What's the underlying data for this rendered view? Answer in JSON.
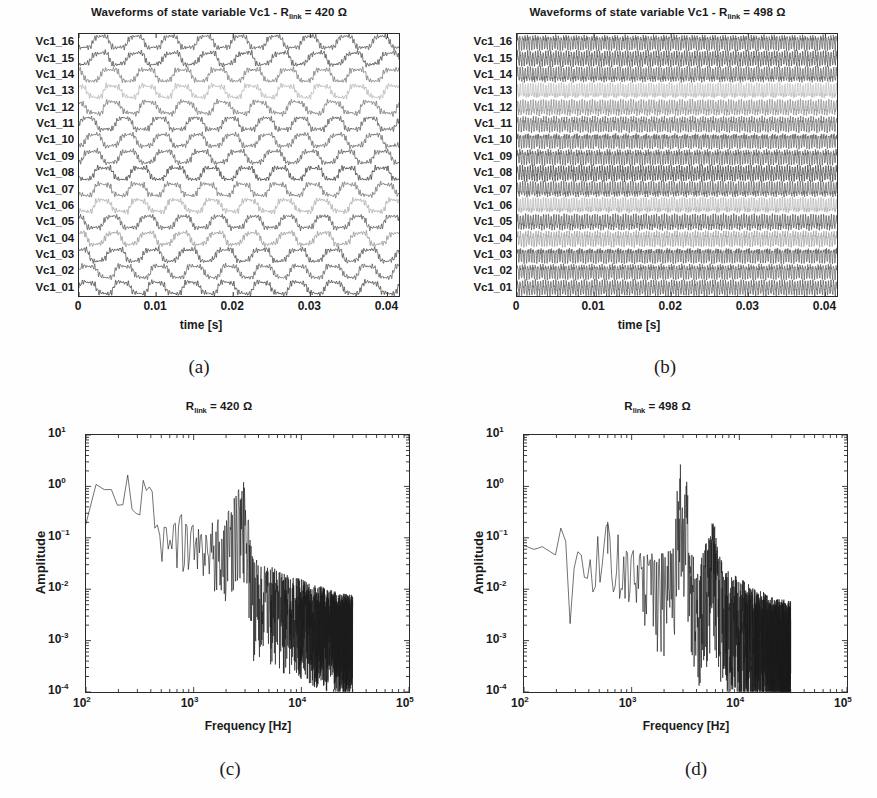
{
  "figure": {
    "background": "#fefefe",
    "ink": "#1a1a1a",
    "width": 877,
    "height": 798
  },
  "panels": [
    {
      "id": "a",
      "caption": "(a)",
      "title_prefix": "Waveforms of state variable Vc1 - R",
      "title_sub": "link",
      "title_suffix": " = 420 Ω",
      "xlabel": "time [s]",
      "ylabel": "",
      "xticks": [
        "0",
        "0.01",
        "0.02",
        "0.03",
        "0.04"
      ],
      "ytick_labels": [
        "Vc1_16",
        "Vc1_15",
        "Vc1_14",
        "Vc1_13",
        "Vc1_12",
        "Vc1_11",
        "Vc1_10",
        "Vc1_09",
        "Vc1_08",
        "Vc1_07",
        "Vc1_06",
        "Vc1_05",
        "Vc1_04",
        "Vc1_03",
        "Vc1_02",
        "Vc1_01"
      ]
    },
    {
      "id": "b",
      "caption": "(b)",
      "title_prefix": "Waveforms of state variable Vc1 - R",
      "title_sub": "link",
      "title_suffix": " = 498 Ω",
      "xlabel": "time [s]",
      "ylabel": "",
      "xticks": [
        "0",
        "0.01",
        "0.02",
        "0.03",
        "0.04"
      ],
      "ytick_labels": [
        "Vc1_16",
        "Vc1_15",
        "Vc1_14",
        "Vc1_13",
        "Vc1_12",
        "Vc1_11",
        "Vc1_10",
        "Vc1_09",
        "Vc1_08",
        "Vc1_07",
        "Vc1_06",
        "Vc1_05",
        "Vc1_04",
        "Vc1_03",
        "Vc1_02",
        "Vc1_01"
      ]
    },
    {
      "id": "c",
      "caption": "(c)",
      "title_prefix": "R",
      "title_sub": "link",
      "title_suffix": " = 420 Ω",
      "xlabel": "Frequency [Hz]",
      "ylabel": "Amplitude",
      "xticks": [
        "10²",
        "10³",
        "10⁴",
        "10⁵"
      ],
      "yticks": [
        "10¹",
        "10⁰",
        "10⁻¹",
        "10⁻²",
        "10⁻³",
        "10⁻⁴"
      ]
    },
    {
      "id": "d",
      "caption": "(d)",
      "title_prefix": "R",
      "title_sub": "link",
      "title_suffix": " = 498 Ω",
      "xlabel": "Frequency [Hz]",
      "ylabel": "Amplitude",
      "xticks": [
        "10²",
        "10³",
        "10⁴",
        "10⁵"
      ],
      "yticks": [
        "10¹",
        "10⁰",
        "10⁻¹",
        "10⁻²",
        "10⁻³",
        "10⁻⁴"
      ]
    }
  ],
  "chart_data": [
    {
      "panel": "a",
      "type": "line",
      "title": "Waveforms of state variable Vc1 - R_link = 420 Ω",
      "xlabel": "time [s]",
      "ylabel": "",
      "xlim": [
        0,
        0.0415
      ],
      "xticks": [
        0,
        0.01,
        0.02,
        0.03,
        0.04
      ],
      "xticklabels": [
        "0",
        "0.01",
        "0.02",
        "0.03",
        "0.04"
      ],
      "grid": false,
      "legend": "none",
      "n_traces": 16,
      "trace_labels": [
        "Vc1_01",
        "Vc1_02",
        "Vc1_03",
        "Vc1_04",
        "Vc1_05",
        "Vc1_06",
        "Vc1_07",
        "Vc1_08",
        "Vc1_09",
        "Vc1_10",
        "Vc1_11",
        "Vc1_12",
        "Vc1_13",
        "Vc1_14",
        "Vc1_15",
        "Vc1_16"
      ],
      "description": "16 stacked quasi-square oscillating traces, fundamental period approx 0.0046 s (about 9 cycles across 0.0415 s), with superimposed high-frequency ripple of about 3 kHz. Traces are chaotic / non-synchronised: each channel has an individual phase offset so the stack looks irregular.",
      "fundamental_hz": 217,
      "ripple_hz": 3000,
      "trace_phase_offsets_deg": [
        0,
        28,
        55,
        96,
        140,
        175,
        210,
        250,
        285,
        312,
        20,
        65,
        118,
        160,
        205,
        240
      ],
      "trace_gray_levels": [
        "#3a3a3a",
        "#555555",
        "#404040",
        "#8e8e8e",
        "#4a4a4a",
        "#a5a5a5",
        "#666666",
        "#2f2f2f",
        "#4f4f4f",
        "#5c5c5c",
        "#4a4a4a",
        "#6a6a6a",
        "#b0b0b0",
        "#6f6f6f",
        "#3d3d3d",
        "#4a4a4a"
      ]
    },
    {
      "panel": "b",
      "type": "line",
      "title": "Waveforms of state variable Vc1 - R_link = 498 Ω",
      "xlabel": "time [s]",
      "ylabel": "",
      "xlim": [
        0,
        0.0415
      ],
      "xticks": [
        0,
        0.01,
        0.02,
        0.03,
        0.04
      ],
      "xticklabels": [
        "0",
        "0.01",
        "0.02",
        "0.03",
        "0.04"
      ],
      "grid": false,
      "legend": "none",
      "n_traces": 16,
      "trace_labels": [
        "Vc1_01",
        "Vc1_02",
        "Vc1_03",
        "Vc1_04",
        "Vc1_05",
        "Vc1_06",
        "Vc1_07",
        "Vc1_08",
        "Vc1_09",
        "Vc1_10",
        "Vc1_11",
        "Vc1_12",
        "Vc1_13",
        "Vc1_14",
        "Vc1_15",
        "Vc1_16"
      ],
      "description": "16 stacked traces, all periodic and synchronised at a much higher rate (~3 kHz bursts) producing a dense regular cross-hatch / braided pattern across the whole window; amplitude is small and uniform so neighbouring traces overlap.",
      "fundamental_hz": 3000,
      "ripple_hz": 6000,
      "trace_phase_offsets_deg": [
        0,
        0,
        0,
        0,
        0,
        0,
        0,
        0,
        0,
        0,
        0,
        0,
        0,
        0,
        0,
        0
      ],
      "trace_gray_levels": [
        "#555555",
        "#5e5e5e",
        "#5a5a5a",
        "#9a9a9a",
        "#4f4f4f",
        "#b4b4b4",
        "#5a5a5a",
        "#3a3a3a",
        "#585858",
        "#606060",
        "#626262",
        "#8a8a8a",
        "#bcbcbc",
        "#5a5a5a",
        "#4a4a4a",
        "#565656"
      ]
    },
    {
      "panel": "c",
      "type": "line",
      "title": "R_link = 420 Ω",
      "xlabel": "Frequency [Hz]",
      "ylabel": "Amplitude",
      "xscale": "log",
      "yscale": "log",
      "xlim": [
        100,
        100000
      ],
      "ylim": [
        0.0001,
        10
      ],
      "xticks": [
        100,
        1000,
        10000,
        100000
      ],
      "xticklabels": [
        "10^2",
        "10^3",
        "10^4",
        "10^5"
      ],
      "yticks": [
        10,
        1,
        0.1,
        0.01,
        0.001,
        0.0001
      ],
      "yticklabels": [
        "10^1",
        "10^0",
        "10^-1",
        "10^-2",
        "10^-3",
        "10^-4"
      ],
      "grid": false,
      "legend": "none",
      "data_end_hz": 30000,
      "description": "Broadband chaotic spectrum. Flat-ish plateau near amplitude 1 from 100 Hz to about 250 Hz, local maximum about 1.6 at 250 Hz, then decaying noisy band around 0.1-0.2 from 500 Hz to 3 kHz, a distinct peak of about 0.55 at 2.9 kHz, a sharp drop after 3.5 kHz to about 0.01, then a noise floor falling from 0.01 to roughly 0.003 out to 30 kHz where the data ends.",
      "envelope_points": [
        {
          "f": 100,
          "a": 0.35
        },
        {
          "f": 120,
          "a": 1.0
        },
        {
          "f": 160,
          "a": 0.7
        },
        {
          "f": 190,
          "a": 0.95
        },
        {
          "f": 230,
          "a": 0.8
        },
        {
          "f": 250,
          "a": 1.6
        },
        {
          "f": 300,
          "a": 0.45
        },
        {
          "f": 340,
          "a": 1.0
        },
        {
          "f": 420,
          "a": 0.55
        },
        {
          "f": 470,
          "a": 0.18
        },
        {
          "f": 700,
          "a": 0.2
        },
        {
          "f": 1200,
          "a": 0.13
        },
        {
          "f": 2000,
          "a": 0.12
        },
        {
          "f": 2900,
          "a": 0.55
        },
        {
          "f": 3200,
          "a": 0.15
        },
        {
          "f": 3600,
          "a": 0.016
        },
        {
          "f": 6000,
          "a": 0.009
        },
        {
          "f": 10000,
          "a": 0.006
        },
        {
          "f": 20000,
          "a": 0.0035
        },
        {
          "f": 30000,
          "a": 0.003
        }
      ],
      "noise_decades": 1.1
    },
    {
      "panel": "d",
      "type": "line",
      "title": "R_link = 498 Ω",
      "xlabel": "Frequency [Hz]",
      "ylabel": "Amplitude",
      "xscale": "log",
      "yscale": "log",
      "xlim": [
        100,
        100000
      ],
      "ylim": [
        0.0001,
        10
      ],
      "xticks": [
        100,
        1000,
        10000,
        100000
      ],
      "xticklabels": [
        "10^2",
        "10^3",
        "10^4",
        "10^5"
      ],
      "yticks": [
        10,
        1,
        0.1,
        0.01,
        0.001,
        0.0001
      ],
      "yticklabels": [
        "10^1",
        "10^0",
        "10^-1",
        "10^-2",
        "10^-3",
        "10^-4"
      ],
      "grid": false,
      "legend": "none",
      "data_end_hz": 30000,
      "description": "Periodic-regime spectrum. Low-frequency content about 0.1-0.2 from 100 to 250 Hz with a deep notch near 270 Hz down to 0.0013, a moderate line at 600 Hz of about 0.2, then two dominant sharp spectral lines at about 2.8 kHz (1.4) and 3.2 kHz (1.0), further discrete lines near 5.5-6 kHz (0.08), and a broadband noise floor decaying from 0.005 at 4 kHz to about 0.0015 at 30 kHz where the data ends.",
      "envelope_points": [
        {
          "f": 100,
          "a": 0.21
        },
        {
          "f": 130,
          "a": 0.09
        },
        {
          "f": 160,
          "a": 0.16
        },
        {
          "f": 190,
          "a": 0.08
        },
        {
          "f": 215,
          "a": 0.14
        },
        {
          "f": 250,
          "a": 0.1
        },
        {
          "f": 270,
          "a": 0.0014
        },
        {
          "f": 300,
          "a": 0.05
        },
        {
          "f": 420,
          "a": 0.03
        },
        {
          "f": 600,
          "a": 0.2
        },
        {
          "f": 800,
          "a": 0.04
        },
        {
          "f": 1300,
          "a": 0.022
        },
        {
          "f": 2000,
          "a": 0.02
        },
        {
          "f": 2500,
          "a": 0.05
        },
        {
          "f": 2800,
          "a": 1.4
        },
        {
          "f": 3000,
          "a": 0.25
        },
        {
          "f": 3200,
          "a": 1.0
        },
        {
          "f": 3500,
          "a": 0.03
        },
        {
          "f": 4000,
          "a": 0.006
        },
        {
          "f": 5800,
          "a": 0.08
        },
        {
          "f": 7000,
          "a": 0.008
        },
        {
          "f": 12000,
          "a": 0.004
        },
        {
          "f": 20000,
          "a": 0.0022
        },
        {
          "f": 30000,
          "a": 0.0018
        }
      ],
      "noise_decades": 1.35,
      "peaks": [
        {
          "f": 2800,
          "a": 1.4
        },
        {
          "f": 3200,
          "a": 1.0
        },
        {
          "f": 600,
          "a": 0.2
        },
        {
          "f": 5800,
          "a": 0.08
        }
      ]
    }
  ]
}
